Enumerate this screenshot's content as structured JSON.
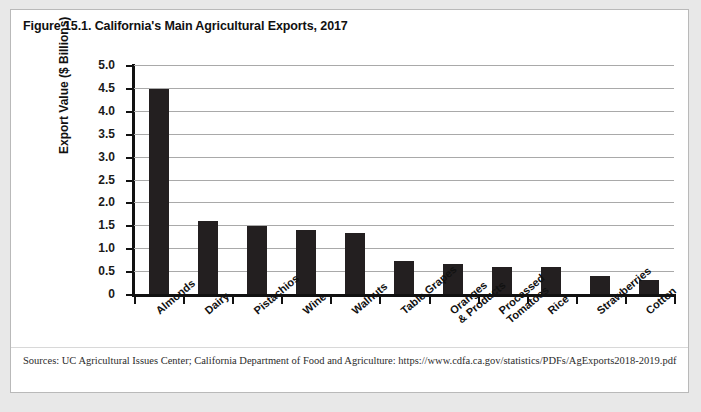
{
  "figure": {
    "title": "Figure 15.1. California's Main Agricultural Exports, 2017",
    "source": "Sources: UC Agricultural Issues Center; California Department of Food and Agriculture: https://www.cdfa.ca.gov/statistics/PDFs/AgExports2018-2019.pdf"
  },
  "colors": {
    "bar": "#231f20",
    "gridline": "#a9a9a9",
    "axis": "#111111",
    "card_background": "#ffffff",
    "page_background": "#e8e8e8",
    "card_border": "#b9b9b9"
  },
  "chart_data": {
    "type": "bar",
    "title": "Figure 15.1. California's Main Agricultural Exports, 2017",
    "xlabel": "",
    "ylabel": "Export Value ($ Billions)",
    "ylim": [
      0,
      5.0
    ],
    "ytick_step": 0.5,
    "ytick_labels": [
      "5.0",
      "4.5",
      "4.0",
      "3.5",
      "3.0",
      "2.5",
      "2.0",
      "1.5",
      "1.0",
      "0.5",
      "0"
    ],
    "ytick_values": [
      5.0,
      4.5,
      4.0,
      3.5,
      3.0,
      2.5,
      2.0,
      1.5,
      1.0,
      0.5,
      0
    ],
    "grid": true,
    "grid_axis": "y",
    "legend": false,
    "categories": [
      "Almonds",
      "Dairy",
      "Pistachios",
      "Wine",
      "Walnuts",
      "Table Grapes",
      "Oranges\n& Products",
      "Processed\nTomatoes",
      "Rice",
      "Strawberries",
      "Cotton"
    ],
    "values": [
      4.48,
      1.59,
      1.48,
      1.39,
      1.34,
      0.73,
      0.65,
      0.6,
      0.59,
      0.39,
      0.31
    ]
  }
}
